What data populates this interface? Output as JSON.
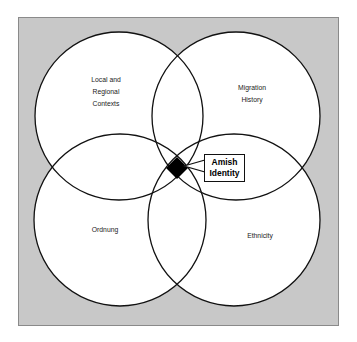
{
  "diagram": {
    "type": "venn",
    "circles": [
      {
        "id": "local",
        "label_lines": [
          "Local and",
          "Regional",
          "Contexts"
        ],
        "cx": 119,
        "cy": 116,
        "r": 84
      },
      {
        "id": "migration",
        "label_lines": [
          "Migration",
          "History"
        ],
        "cx": 236,
        "cy": 116,
        "r": 84
      },
      {
        "id": "ordnung",
        "label_lines": [
          "Ordnung"
        ],
        "cx": 120,
        "cy": 220,
        "r": 86
      },
      {
        "id": "ethnicity",
        "label_lines": [
          "Ethnicity"
        ],
        "cx": 234,
        "cy": 220,
        "r": 86
      }
    ],
    "center": {
      "label_lines": [
        "Amish",
        "Identity"
      ],
      "marker": "black-diamond"
    },
    "colors": {
      "background": "#c8c8c8",
      "circle_fill": "#ffffff",
      "stroke": "#111111",
      "center_marker": "#000000"
    }
  }
}
